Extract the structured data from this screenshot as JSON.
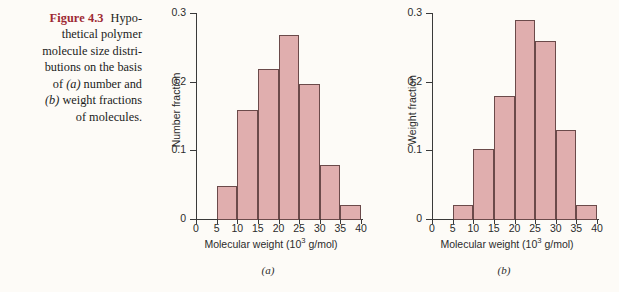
{
  "figure": {
    "number_label": "Figure 4.3",
    "caption_lines": [
      "Hypo-",
      "thetical polymer",
      "molecule size distri-",
      "butions on the basis",
      "of (a) number and",
      "(b) weight fractions",
      "of molecules."
    ],
    "number_color": "#9d2933",
    "bar_fill": "#e0aeae",
    "bar_stroke": "#6b4a4a",
    "axis_color": "#3a3a3a",
    "background": "#fdfbf7"
  },
  "chart_data": [
    {
      "type": "bar",
      "panel": "a",
      "panel_label": "(a)",
      "title": "",
      "xlabel": "Molecular weight (10",
      "xlabel_sup": "3",
      "xlabel_tail": " g/mol)",
      "ylabel": "Number fraction",
      "xlim": [
        0,
        40
      ],
      "ylim": [
        0,
        0.3
      ],
      "grid": false,
      "legend": "none",
      "xticks": [
        0,
        5,
        10,
        15,
        20,
        25,
        30,
        35,
        40
      ],
      "yticks": [
        0,
        0.1,
        0.2,
        0.3
      ],
      "ytick_labels": [
        "0",
        "0.1",
        "0.2",
        "0.3"
      ],
      "bin_edges": [
        5,
        10,
        15,
        20,
        25,
        30,
        35,
        40
      ],
      "categories": [
        "5-10",
        "10-15",
        "15-20",
        "20-25",
        "25-30",
        "30-35",
        "35-40"
      ],
      "values": [
        0.05,
        0.16,
        0.22,
        0.27,
        0.198,
        0.08,
        0.022
      ]
    },
    {
      "type": "bar",
      "panel": "b",
      "panel_label": "(b)",
      "title": "",
      "xlabel": "Molecular weight (10",
      "xlabel_sup": "3",
      "xlabel_tail": " g/mol)",
      "ylabel": "Weight fraction",
      "xlim": [
        0,
        40
      ],
      "ylim": [
        0,
        0.3
      ],
      "grid": false,
      "legend": "none",
      "xticks": [
        0,
        5,
        10,
        15,
        20,
        25,
        30,
        35,
        40
      ],
      "yticks": [
        0,
        0.1,
        0.2,
        0.3
      ],
      "ytick_labels": [
        "0",
        "0.1",
        "0.2",
        "0.3"
      ],
      "bin_edges": [
        5,
        10,
        15,
        20,
        25,
        30,
        35,
        40
      ],
      "categories": [
        "5-10",
        "10-15",
        "15-20",
        "20-25",
        "25-30",
        "30-35",
        "35-40"
      ],
      "values": [
        0.022,
        0.104,
        0.18,
        0.292,
        0.261,
        0.131,
        0.022
      ]
    }
  ]
}
